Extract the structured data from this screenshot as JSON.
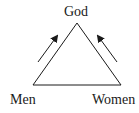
{
  "diagram": {
    "type": "triangle",
    "nodes": {
      "top": "God",
      "bottom_left": "Men",
      "bottom_right": "Women"
    },
    "arrows": [
      {
        "from": "Men",
        "to": "God"
      },
      {
        "from": "Women",
        "to": "God"
      }
    ],
    "colors": {
      "stroke": "#1a1a1a",
      "background": "#ffffff"
    }
  }
}
